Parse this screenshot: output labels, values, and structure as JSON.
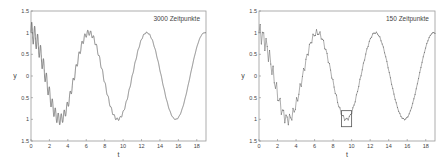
{
  "chart_data": [
    {
      "type": "line",
      "title": "",
      "annotation": "3000 Zeitpunkte",
      "xlabel": "t",
      "ylabel": "y",
      "xlim": [
        0,
        19
      ],
      "ylim": [
        -1.5,
        1.5
      ],
      "xticks": [
        0,
        2,
        4,
        6,
        8,
        10,
        12,
        14,
        16,
        18
      ],
      "yticks": [
        1.5,
        1,
        0.5,
        0,
        -0.5,
        -1,
        -1.5
      ],
      "ytick_labels": [
        "1.5",
        "1",
        "0.5",
        "0",
        "0.5",
        "1",
        "1.5"
      ],
      "grid": false,
      "series": [
        {
          "name": "y(t)",
          "description": "cos(t) plus decaying high-frequency oscillation, sampled at 3000 time points",
          "samples": 3000,
          "x": [
            0,
            1,
            2,
            3,
            4,
            5,
            6,
            7,
            8,
            9,
            10,
            11,
            12,
            13,
            14,
            15,
            16,
            17,
            18,
            19
          ],
          "values": [
            1.0,
            0.54,
            -0.42,
            -0.99,
            -0.65,
            0.28,
            0.96,
            0.75,
            -0.15,
            -0.91,
            -0.84,
            0.0,
            0.84,
            0.91,
            0.14,
            -0.76,
            -0.96,
            -0.28,
            0.66,
            0.99
          ]
        }
      ],
      "envelope_amplitude_start": 0.25
    },
    {
      "type": "line",
      "title": "",
      "annotation": "150  Zeitpunkte",
      "xlabel": "t",
      "ylabel": "y",
      "xlim": [
        0,
        19
      ],
      "ylim": [
        -1.5,
        1.5
      ],
      "xticks": [
        0,
        2,
        4,
        6,
        8,
        10,
        12,
        14,
        16,
        18
      ],
      "yticks": [
        1.5,
        1,
        0.5,
        0,
        -0.5,
        -1,
        -1.5
      ],
      "ytick_labels": [
        "1.5",
        "1",
        "0.5",
        "0",
        "0.5",
        "1",
        "1.5"
      ],
      "grid": false,
      "series": [
        {
          "name": "y(t)",
          "description": "same signal sampled at 150 time points (aliased jagged line with markers)",
          "samples": 150,
          "x": [
            0,
            1,
            2,
            3,
            4,
            5,
            6,
            7,
            8,
            9,
            10,
            11,
            12,
            13,
            14,
            15,
            16,
            17,
            18,
            19
          ],
          "values": [
            1.0,
            0.54,
            -0.42,
            -0.99,
            -0.65,
            0.28,
            0.96,
            0.75,
            -0.15,
            -0.91,
            -0.84,
            0.0,
            0.84,
            0.91,
            0.14,
            -0.76,
            -0.96,
            -0.28,
            0.66,
            0.99
          ]
        }
      ],
      "highlight_box": {
        "x": [
          8.9,
          10.0
        ],
        "y": [
          -1.17,
          -0.8
        ],
        "label": "W-shaped detail"
      }
    }
  ]
}
